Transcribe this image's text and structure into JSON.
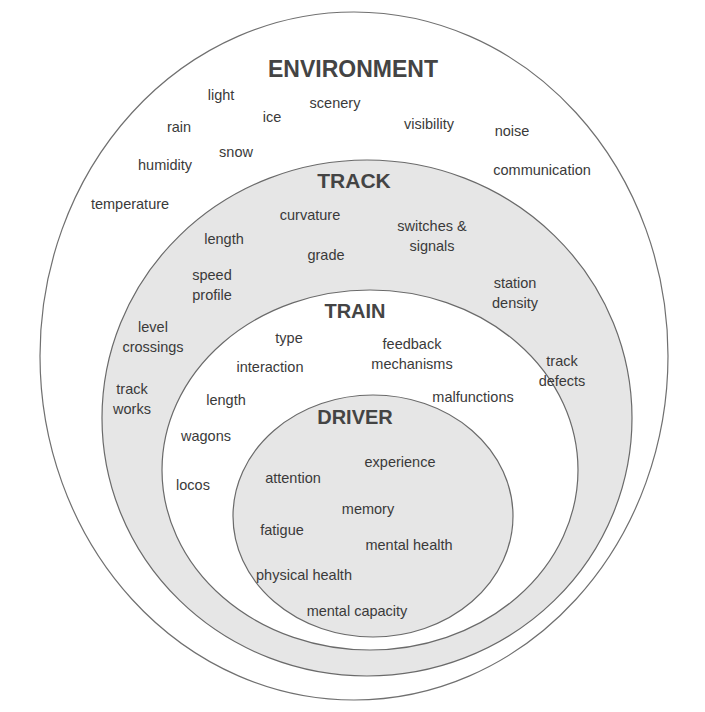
{
  "colors": {
    "background": "#ffffff",
    "ring_fill": "#e6e6e6",
    "inner_fill": "#ffffff",
    "stroke": "#6f6f6f",
    "text": "#3a3a3a"
  },
  "layers": {
    "environment": {
      "title": "ENVIRONMENT",
      "items": [
        "light",
        "ice",
        "scenery",
        "rain",
        "visibility",
        "noise",
        "snow",
        "humidity",
        "communication",
        "temperature"
      ]
    },
    "track": {
      "title": "TRACK",
      "items": [
        "curvature",
        "length",
        "switches & signals",
        "grade",
        "speed profile",
        "station density",
        "level crossings",
        "track works",
        "track defects"
      ]
    },
    "train": {
      "title": "TRAIN",
      "items": [
        "type",
        "feedback mechanisms",
        "interaction",
        "length",
        "malfunctions",
        "wagons",
        "locos"
      ]
    },
    "driver": {
      "title": "DRIVER",
      "items": [
        "experience",
        "attention",
        "memory",
        "fatigue",
        "mental health",
        "physical health",
        "mental capacity"
      ]
    }
  }
}
